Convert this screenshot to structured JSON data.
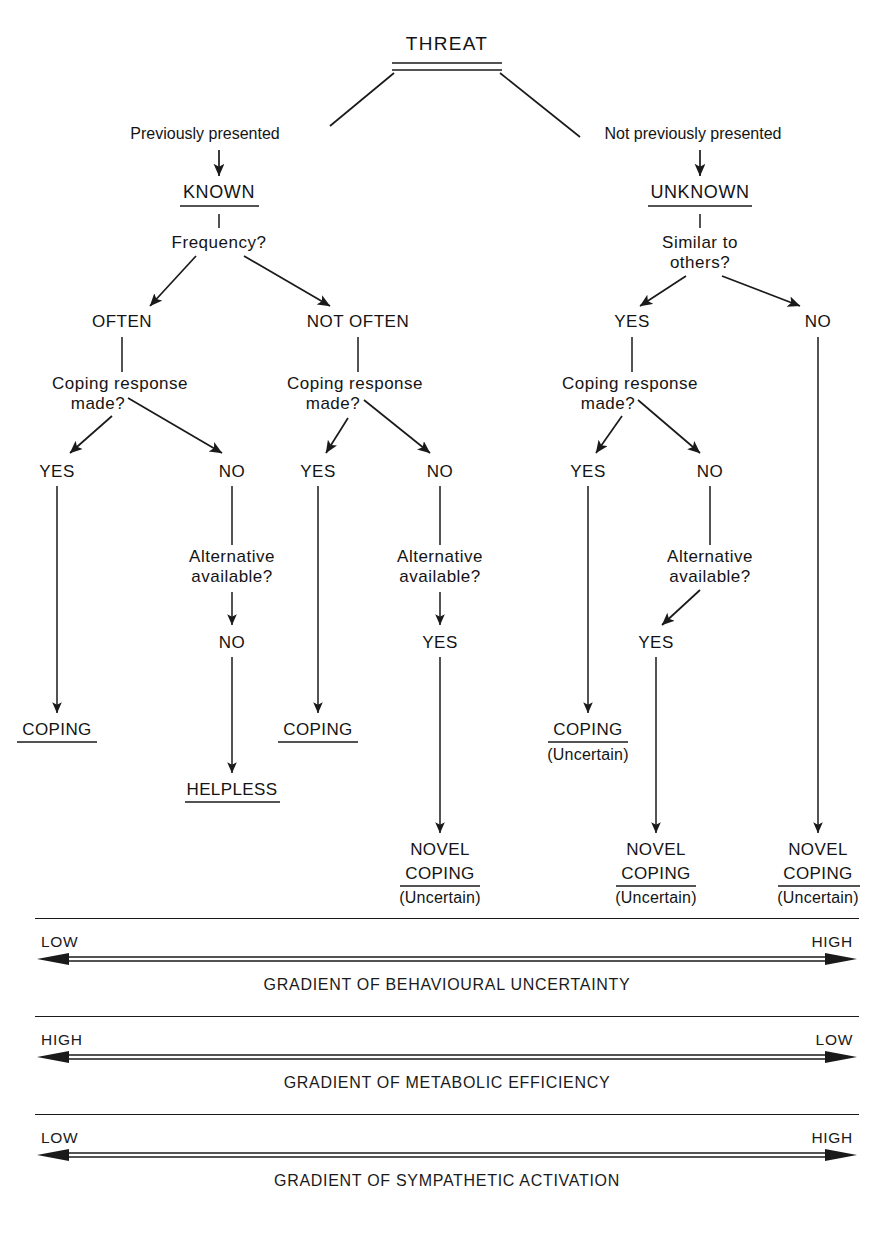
{
  "figure": {
    "root": {
      "label": "THREAT",
      "underline": "double"
    },
    "branches": {
      "left_edge_label": "Previously presented",
      "right_edge_label": "Not previously presented"
    },
    "states": [
      {
        "id": "known",
        "label": "KNOWN",
        "underlined": true
      },
      {
        "id": "unknown",
        "label": "UNKNOWN",
        "underlined": true
      }
    ],
    "questions": {
      "frequency": "Frequency?",
      "similar_line1": "Similar to",
      "similar_line2": "others?",
      "coping_line1": "Coping response",
      "coping_line2": "made?",
      "alternative_line1": "Alternative",
      "alternative_line2": "available?"
    },
    "frequency_options": {
      "left": "OFTEN",
      "right": "NOT OFTEN"
    },
    "similar_options": {
      "left": "YES",
      "right": "NO"
    },
    "yes": "YES",
    "no": "NO",
    "outcomes": {
      "coping": "COPING",
      "helpless": "HELPLESS",
      "novel_line1": "NOVEL",
      "novel_line2": "COPING",
      "uncertain": "(Uncertain)"
    },
    "paths": [
      {
        "id": "known-often-yes",
        "state": "KNOWN",
        "frequency": "OFTEN",
        "coping_response_made": "YES",
        "alternative_available": null,
        "outcome": "COPING",
        "uncertain": false
      },
      {
        "id": "known-often-no",
        "state": "KNOWN",
        "frequency": "OFTEN",
        "coping_response_made": "NO",
        "alternative_available": "NO",
        "outcome": "HELPLESS",
        "uncertain": false
      },
      {
        "id": "known-notoften-yes",
        "state": "KNOWN",
        "frequency": "NOT OFTEN",
        "coping_response_made": "YES",
        "alternative_available": null,
        "outcome": "COPING",
        "uncertain": false
      },
      {
        "id": "known-notoften-no",
        "state": "KNOWN",
        "frequency": "NOT OFTEN",
        "coping_response_made": "NO",
        "alternative_available": "YES",
        "outcome": "NOVEL COPING",
        "uncertain": true
      },
      {
        "id": "unknown-similar-yes-coping-yes",
        "state": "UNKNOWN",
        "similar_to_others": "YES",
        "coping_response_made": "YES",
        "alternative_available": null,
        "outcome": "COPING",
        "uncertain": true
      },
      {
        "id": "unknown-similar-yes-coping-no",
        "state": "UNKNOWN",
        "similar_to_others": "YES",
        "coping_response_made": "NO",
        "alternative_available": "YES",
        "outcome": "NOVEL COPING",
        "uncertain": true
      },
      {
        "id": "unknown-similar-no",
        "state": "UNKNOWN",
        "similar_to_others": "NO",
        "coping_response_made": null,
        "alternative_available": null,
        "outcome": "NOVEL COPING",
        "uncertain": true
      }
    ]
  },
  "gradients": [
    {
      "id": "behavioural-uncertainty",
      "left_end": "LOW",
      "right_end": "HIGH",
      "caption": "GRADIENT OF BEHAVIOURAL UNCERTAINTY"
    },
    {
      "id": "metabolic-efficiency",
      "left_end": "HIGH",
      "right_end": "LOW",
      "caption": "GRADIENT OF METABOLIC EFFICIENCY"
    },
    {
      "id": "sympathetic-activation",
      "left_end": "LOW",
      "right_end": "HIGH",
      "caption": "GRADIENT OF SYMPATHETIC ACTIVATION"
    }
  ],
  "colors": {
    "ink": "#1a1a1a",
    "background": "#ffffff"
  }
}
